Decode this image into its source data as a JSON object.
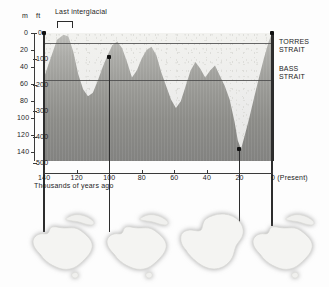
{
  "figure": {
    "annotation": "Last interglacial"
  },
  "axes": {
    "left_unit_m": "m",
    "left_unit_ft": "ft",
    "m_ticks": [
      "0",
      "20",
      "40",
      "60",
      "80",
      "100",
      "120",
      "140"
    ],
    "ft_ticks": [
      "0",
      "100",
      "200",
      "300",
      "400",
      "500"
    ],
    "x_ticks": [
      "140",
      "120",
      "100",
      "80",
      "60",
      "40",
      "20",
      "0 (Present)"
    ],
    "x_label": "Thousands of years ago"
  },
  "reference_lines": [
    {
      "label_line1": "TORRES",
      "label_line2": "STRAIT",
      "depth_m": 12
    },
    {
      "label_line1": "BASS",
      "label_line2": "STRAIT",
      "depth_m": 55
    }
  ],
  "colors": {
    "water": "#9a9a96",
    "land_exposed": "#ececea",
    "axis": "#3a3a3a",
    "gridline": "#4c4c4c",
    "marker": "#2d2d2d"
  },
  "chart_data": {
    "type": "area",
    "xlabel": "Thousands of years ago",
    "ylabel": "Depth below present sea level",
    "xlim": [
      140,
      0
    ],
    "ylim": [
      0,
      150
    ],
    "y_unit_primary": "m",
    "y_unit_secondary": "ft",
    "grid": false,
    "legend": "none",
    "x_reversed": true,
    "series": [
      {
        "name": "Sea level below present (m)",
        "x": [
          140,
          136,
          132,
          128,
          125,
          122,
          119,
          116,
          113,
          110,
          107,
          104,
          101,
          98,
          95,
          92,
          89,
          86,
          83,
          80,
          77,
          74,
          71,
          68,
          65,
          62,
          59,
          56,
          53,
          50,
          47,
          44,
          41,
          38,
          35,
          32,
          29,
          26,
          23,
          21,
          19,
          17,
          14,
          11,
          8,
          5,
          2,
          0
        ],
        "values": [
          52,
          30,
          8,
          2,
          4,
          22,
          48,
          66,
          74,
          70,
          56,
          40,
          26,
          14,
          10,
          18,
          34,
          52,
          44,
          30,
          20,
          16,
          26,
          46,
          62,
          78,
          88,
          80,
          62,
          44,
          34,
          42,
          52,
          44,
          38,
          50,
          62,
          78,
          104,
          126,
          136,
          122,
          100,
          76,
          52,
          30,
          10,
          0
        ]
      }
    ],
    "annotations": [
      {
        "text": "Last interglacial",
        "x_range": [
          132,
          122
        ],
        "type": "brace"
      },
      {
        "text": "TORRES STRAIT",
        "y": 12,
        "type": "hline-label"
      },
      {
        "text": "BASS STRAIT",
        "y": 55,
        "type": "hline-label"
      }
    ],
    "markers": [
      {
        "x": 140,
        "y": 0,
        "leads_to_map": 1
      },
      {
        "x": 100,
        "y": 28,
        "leads_to_map": 2
      },
      {
        "x": 20,
        "y": 136,
        "leads_to_map": 3
      },
      {
        "x": 0,
        "y": 0,
        "leads_to_map": 4
      }
    ]
  },
  "maps": [
    {
      "name": "australia-map-140ka",
      "caption": "",
      "joined": false
    },
    {
      "name": "australia-map-100ka",
      "caption": "",
      "joined": false
    },
    {
      "name": "australia-map-20ka-sahul",
      "caption": "",
      "joined": true
    },
    {
      "name": "australia-map-present",
      "caption": "",
      "joined": false
    }
  ]
}
